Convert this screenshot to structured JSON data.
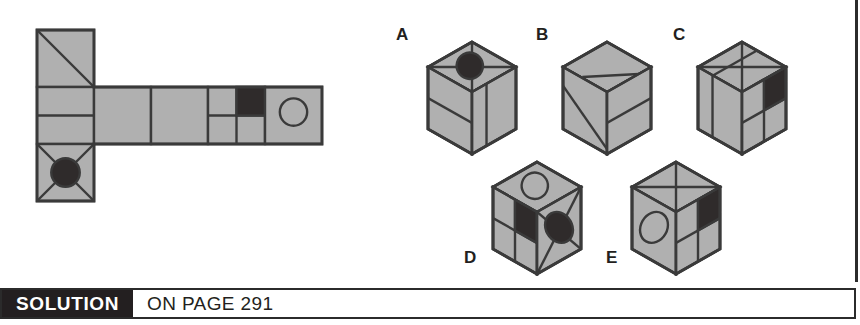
{
  "page": {
    "kind": "spatial-reasoning-puzzle",
    "prompt_type": "cube-net-matching"
  },
  "colors": {
    "face_gray": "#b0b0b0",
    "ink": "#3a3a3a",
    "dark_fill": "#2f2b2b",
    "white": "#ffffff",
    "footer_bg": "#231f20"
  },
  "footer": {
    "solution_label": "SOLUTION",
    "page_text": "ON PAGE 291"
  },
  "net": {
    "name": "cube-net",
    "origin": {
      "x": 37,
      "y": 30
    },
    "cell": 57,
    "cells": [
      {
        "id": "net-cell-top",
        "col": 0,
        "row": 0,
        "marks": [
          "diagonal-tl-br"
        ]
      },
      {
        "id": "net-cell-left-mid",
        "col": 0,
        "row": 1,
        "marks": [
          "horizontal-mid-line"
        ]
      },
      {
        "id": "net-cell-bottom",
        "col": 0,
        "row": 2,
        "marks": [
          "x-diagonals",
          "filled-circle"
        ]
      },
      {
        "id": "net-cell-2",
        "col": 1,
        "row": 1,
        "marks": []
      },
      {
        "id": "net-cell-3",
        "col": 2,
        "row": 1,
        "marks": []
      },
      {
        "id": "net-cell-4",
        "col": 3,
        "row": 1,
        "marks": [
          "quadrants",
          "dark-top-right-quadrant"
        ]
      },
      {
        "id": "net-cell-5",
        "col": 4,
        "row": 1,
        "marks": [
          "outline-circle"
        ]
      }
    ]
  },
  "options": [
    {
      "label": "A",
      "name": "cube-option-a",
      "label_pos": {
        "x": 396,
        "y": 28
      },
      "center": {
        "x": 472,
        "y": 92
      },
      "top_face": [
        "x-diagonals",
        "filled-ellipse"
      ],
      "left_face": [
        "horizontal-line"
      ],
      "right_face": [
        "vertical-line"
      ]
    },
    {
      "label": "B",
      "name": "cube-option-b",
      "label_pos": {
        "x": 535,
        "y": 28
      },
      "center": {
        "x": 607,
        "y": 92
      },
      "top_face": [
        "diagonal-band"
      ],
      "left_face": [
        "diagonal-line"
      ],
      "right_face": [
        "horizontal-line"
      ]
    },
    {
      "label": "C",
      "name": "cube-option-c",
      "label_pos": {
        "x": 672,
        "y": 28
      },
      "center": {
        "x": 742,
        "y": 92
      },
      "top_face": [
        "x-diagonals",
        "horizontal-band"
      ],
      "left_face": [
        "vertical-line"
      ],
      "right_face": [
        "quadrants",
        "dark-top-right-quadrant"
      ]
    },
    {
      "label": "D",
      "name": "cube-option-d",
      "label_pos": {
        "x": 464,
        "y": 252
      },
      "center": {
        "x": 537,
        "y": 212
      },
      "top_face": [
        "outline-ellipse"
      ],
      "left_face": [
        "quadrants",
        "dark-top-right-quadrant"
      ],
      "right_face": [
        "x-diagonals",
        "filled-ellipse"
      ]
    },
    {
      "label": "E",
      "name": "cube-option-e",
      "label_pos": {
        "x": 606,
        "y": 252
      },
      "center": {
        "x": 676,
        "y": 212
      },
      "top_face": [
        "x-diagonals"
      ],
      "left_face": [
        "outline-ellipse"
      ],
      "right_face": [
        "quadrants",
        "dark-top-right-quadrant"
      ]
    }
  ]
}
